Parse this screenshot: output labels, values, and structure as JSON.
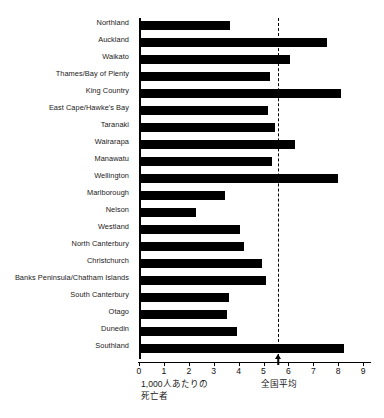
{
  "chart_data": {
    "type": "bar",
    "orientation": "horizontal",
    "title": "",
    "xlabel": "1,000人あたりの\n死亡者",
    "ylabel": "",
    "xlim": [
      0,
      9.35
    ],
    "xticks": [
      0,
      1,
      2,
      3,
      4,
      5,
      6,
      7,
      8,
      9
    ],
    "xtick_labels": [
      "0",
      "1",
      "2",
      "3",
      "4",
      "5",
      "6",
      "7",
      "8",
      "9"
    ],
    "grid": false,
    "legend": null,
    "bar_color": "#000000",
    "categories": [
      "Northland",
      "Auckland",
      "Waikato",
      "Thames/Bay of Plenty",
      "King Country",
      "East Cape/Hawke's Bay",
      "Taranaki",
      "Wairarapa",
      "Manawatu",
      "Wellington",
      "Marlborough",
      "Nelson",
      "Westland",
      "North Canterbury",
      "Christchurch",
      "Banks Peninsula/Chatham Islands",
      "South Canterbury",
      "Otago",
      "Dunedin",
      "Southland"
    ],
    "values": [
      3.65,
      7.55,
      6.05,
      5.25,
      8.1,
      5.2,
      5.45,
      6.25,
      5.35,
      8.0,
      3.45,
      2.28,
      4.05,
      4.2,
      4.95,
      5.1,
      3.6,
      3.55,
      3.95,
      8.25
    ],
    "annotations": [
      {
        "name": "national-average",
        "label": "全国平均",
        "value": 5.6,
        "style": "dashed-vertical-line-with-arrow"
      }
    ]
  },
  "axis": {
    "x_caption_line1": "1,000人あたりの",
    "x_caption_line2": "死亡者"
  }
}
